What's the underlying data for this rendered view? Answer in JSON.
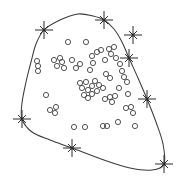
{
  "figure": {
    "title": "",
    "background_color": "#ffffff",
    "width": 185,
    "height": 181
  },
  "chart_data": {
    "type": "scatter",
    "title": "",
    "xlabel": "",
    "ylabel": "",
    "xlim": [
      0,
      185
    ],
    "ylim": [
      0,
      181
    ],
    "grid": false,
    "legend": "none",
    "axes_visible": false,
    "annotations": [
      "closed smooth boundary curve enclosing the point cloud"
    ],
    "series": [
      {
        "name": "points",
        "marker": "open-circle",
        "marker_size": 2.6,
        "color": "#4a4a4a",
        "count": 60,
        "points": [
          [
            68,
            42
          ],
          [
            86,
            42
          ],
          [
            37,
            61
          ],
          [
            38,
            66
          ],
          [
            38,
            71
          ],
          [
            54,
            60
          ],
          [
            60,
            58
          ],
          [
            62,
            62
          ],
          [
            57,
            66
          ],
          [
            64,
            68
          ],
          [
            72,
            60
          ],
          [
            76,
            68
          ],
          [
            80,
            64
          ],
          [
            92,
            56
          ],
          [
            93,
            63
          ],
          [
            90,
            70
          ],
          [
            97,
            52
          ],
          [
            101,
            50
          ],
          [
            105,
            60
          ],
          [
            109,
            49
          ],
          [
            111,
            54
          ],
          [
            114,
            47
          ],
          [
            116,
            58
          ],
          [
            120,
            64
          ],
          [
            122,
            71
          ],
          [
            46,
            95
          ],
          [
            50,
            110
          ],
          [
            55,
            113
          ],
          [
            56,
            107
          ],
          [
            74,
            127
          ],
          [
            85,
            127
          ],
          [
            80,
            83
          ],
          [
            82,
            88
          ],
          [
            86,
            82
          ],
          [
            88,
            90
          ],
          [
            92,
            86
          ],
          [
            95,
            81
          ],
          [
            97,
            91
          ],
          [
            99,
            85
          ],
          [
            103,
            88
          ],
          [
            84,
            95
          ],
          [
            88,
            98
          ],
          [
            92,
            94
          ],
          [
            106,
            74
          ],
          [
            110,
            78
          ],
          [
            105,
            99
          ],
          [
            110,
            97
          ],
          [
            112,
            102
          ],
          [
            115,
            96
          ],
          [
            119,
            88
          ],
          [
            124,
            77
          ],
          [
            127,
            82
          ],
          [
            103,
            126
          ],
          [
            107,
            126
          ],
          [
            118,
            122
          ],
          [
            126,
            108
          ],
          [
            131,
            107
          ],
          [
            133,
            113
          ],
          [
            128,
            94
          ],
          [
            135,
            126
          ]
        ]
      },
      {
        "name": "boundary-vertices",
        "marker": "star-8",
        "marker_size": 9,
        "color": "#2b2b2b",
        "count": 8,
        "points": [
          [
            44,
            30
          ],
          [
            104,
            20
          ],
          [
            133,
            35
          ],
          [
            129,
            58
          ],
          [
            147,
            99
          ],
          [
            164,
            164
          ],
          [
            72,
            148
          ],
          [
            22,
            119
          ]
        ],
        "notes": "star at (133,35) lies off the curve; the other seven sit on the boundary"
      }
    ],
    "boundary_path": [
      [
        44,
        30
      ],
      [
        60,
        20
      ],
      [
        78,
        14
      ],
      [
        93,
        16
      ],
      [
        104,
        20
      ],
      [
        114,
        29
      ],
      [
        122,
        42
      ],
      [
        129,
        58
      ],
      [
        138,
        78
      ],
      [
        147,
        99
      ],
      [
        156,
        122
      ],
      [
        163,
        144
      ],
      [
        164,
        164
      ],
      [
        152,
        170
      ],
      [
        130,
        168
      ],
      [
        104,
        160
      ],
      [
        72,
        148
      ],
      [
        50,
        140
      ],
      [
        32,
        132
      ],
      [
        22,
        119
      ],
      [
        22,
        103
      ],
      [
        26,
        82
      ],
      [
        31,
        62
      ],
      [
        36,
        44
      ],
      [
        44,
        30
      ]
    ]
  },
  "markers": {
    "point_label": "data-point",
    "star_label": "boundary-vertex-star"
  }
}
